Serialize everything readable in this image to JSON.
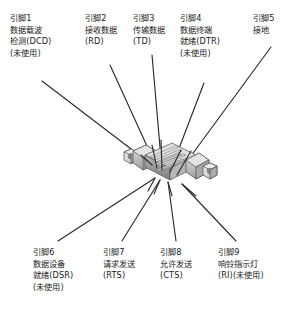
{
  "figure": {
    "type": "db9-serial-connector-pinout",
    "background_color": "#ffffff",
    "text_color": "#1a1a1a",
    "leader_line_color": "#2b2b2b",
    "connector_body_color": "#c9c9c9",
    "connector_outline_color": "#555555"
  },
  "connector": {
    "name": "db9-connector-graphic",
    "description": "DB9 serial connector"
  },
  "pins": [
    {
      "id": "pin1",
      "number": "1",
      "lines": [
        "引脚1",
        "数据载波",
        "检测(DCD)",
        "(未使用)"
      ],
      "abbr": "DCD",
      "position": "top"
    },
    {
      "id": "pin2",
      "number": "2",
      "lines": [
        "引脚2",
        "接收数据",
        "(RD)"
      ],
      "abbr": "RD",
      "position": "top"
    },
    {
      "id": "pin3",
      "number": "3",
      "lines": [
        "引脚3",
        "传输数据",
        "(TD)"
      ],
      "abbr": "TD",
      "position": "top"
    },
    {
      "id": "pin4",
      "number": "4",
      "lines": [
        "引脚4",
        "数据终端",
        "就绪(DTR)",
        "(未使用)"
      ],
      "abbr": "DTR",
      "position": "top"
    },
    {
      "id": "pin5",
      "number": "5",
      "lines": [
        "引脚5",
        "接地"
      ],
      "abbr": "",
      "position": "top"
    },
    {
      "id": "pin6",
      "number": "6",
      "lines": [
        "引脚6",
        "数据设备",
        "就绪(DSR)",
        "(未使用)"
      ],
      "abbr": "DSR",
      "position": "bottom"
    },
    {
      "id": "pin7",
      "number": "7",
      "lines": [
        "引脚7",
        "请求发送",
        "(RTS)"
      ],
      "abbr": "RTS",
      "position": "bottom"
    },
    {
      "id": "pin8",
      "number": "8",
      "lines": [
        "引脚8",
        "允许发送",
        "(CTS)"
      ],
      "abbr": "CTS",
      "position": "bottom"
    },
    {
      "id": "pin9",
      "number": "9",
      "lines": [
        "引脚9",
        "响铃指示灯",
        "(RI)(未使用)"
      ],
      "abbr": "RI",
      "position": "bottom"
    }
  ]
}
